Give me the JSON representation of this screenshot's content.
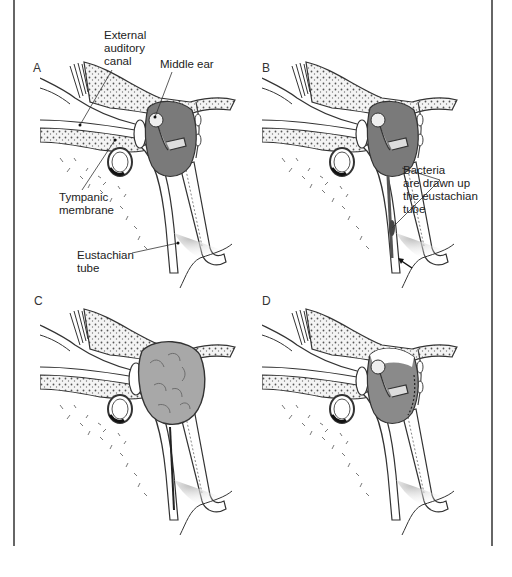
{
  "figure": {
    "panels": [
      {
        "id": "A",
        "letter": "A",
        "state": "normal"
      },
      {
        "id": "B",
        "letter": "B",
        "state": "bacteria-ascending"
      },
      {
        "id": "C",
        "letter": "C",
        "state": "middle-ear-filled-with-pus"
      },
      {
        "id": "D",
        "letter": "D",
        "state": "fluid-receding"
      }
    ],
    "labels": {
      "external_auditory_canal": [
        "External",
        "auditory",
        "canal"
      ],
      "middle_ear": "Middle ear",
      "tympanic_membrane": [
        "Tympanic",
        "membrane"
      ],
      "eustachian_tube": [
        "Eustachian",
        "tube"
      ],
      "bacteria": [
        "Bacteria",
        "are drawn up",
        "the eustachian",
        "tube"
      ]
    },
    "colors": {
      "middle_ear_fill": "#7a7a7a",
      "pus_fill": "#a8a8a8",
      "bone_fill": "#f2f2f2",
      "outline": "#333333",
      "frame": "#666666",
      "background": "#ffffff"
    }
  }
}
